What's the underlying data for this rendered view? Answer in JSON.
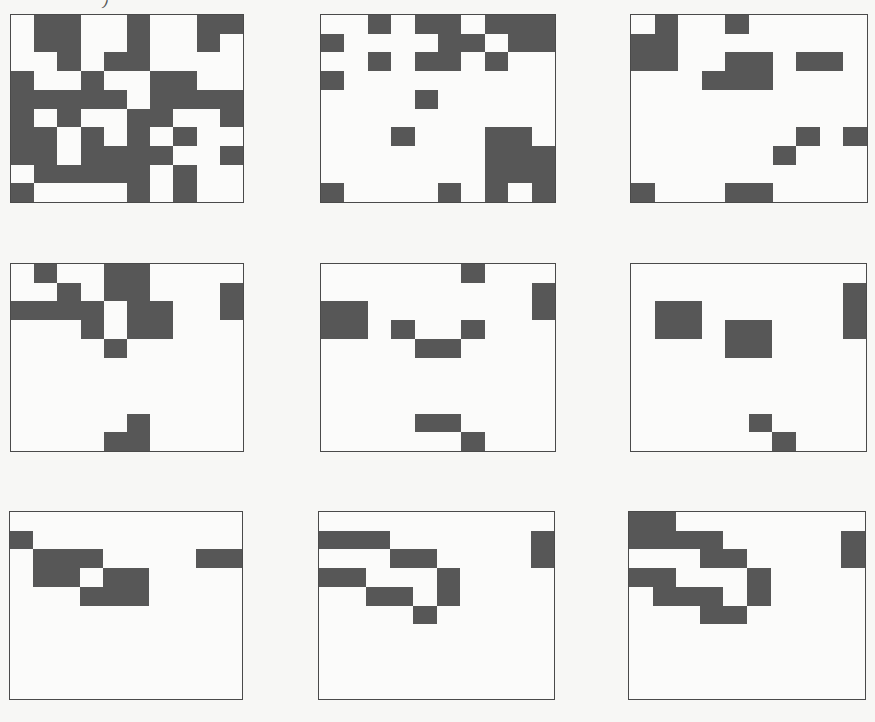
{
  "figure": {
    "top_fragment": ")",
    "grid_size": {
      "rows": 10,
      "cols": 10
    },
    "colors": {
      "filled": "#575757",
      "empty": "#fbfbfa",
      "border": "#4a4a4a",
      "background": "#f7f7f5"
    },
    "panels": [
      {
        "id": "panel-1-1",
        "row": 1,
        "col": 1,
        "cells": [
          "0110010011",
          "0110010010",
          "0010110000",
          "1001001100",
          "1111101111",
          "1010011001",
          "1101010100",
          "1101111001",
          "0111110100",
          "1000010100"
        ]
      },
      {
        "id": "panel-1-2",
        "row": 1,
        "col": 2,
        "cells": [
          "0010110111",
          "1000011011",
          "0010110100",
          "1000000000",
          "0000100000",
          "0000000000",
          "0001000110",
          "0000000111",
          "0000000111",
          "1000010101"
        ]
      },
      {
        "id": "panel-1-3",
        "row": 1,
        "col": 3,
        "cells": [
          "0100100000",
          "1100000000",
          "1100110110",
          "0001110000",
          "0000000000",
          "0000000000",
          "0000000101",
          "0000001000",
          "0000000000",
          "1000110000"
        ]
      },
      {
        "id": "panel-2-1",
        "row": 2,
        "col": 1,
        "cells": [
          "0100110000",
          "0010110001",
          "1111011001",
          "0001011000",
          "0000100000",
          "0000000000",
          "0000000000",
          "0000000000",
          "0000010000",
          "0000110000"
        ]
      },
      {
        "id": "panel-2-2",
        "row": 2,
        "col": 2,
        "cells": [
          "0000001000",
          "0000000001",
          "1100000001",
          "1101001000",
          "0000110000",
          "0000000000",
          "0000000000",
          "0000000000",
          "0000110000",
          "0000001000"
        ]
      },
      {
        "id": "panel-2-3",
        "row": 2,
        "col": 3,
        "cells": [
          "0000000000",
          "0000000001",
          "0110000001",
          "0110110001",
          "0000110000",
          "0000000000",
          "0000000000",
          "0000000000",
          "0000010000",
          "0000001000"
        ]
      },
      {
        "id": "panel-3-1",
        "row": 3,
        "col": 1,
        "cells": [
          "0000000000",
          "1000000000",
          "0111000011",
          "0110110000",
          "0001110000",
          "0000000000",
          "0000000000",
          "0000000000",
          "0000000000",
          "0000000000"
        ]
      },
      {
        "id": "panel-3-2",
        "row": 3,
        "col": 2,
        "cells": [
          "0000000000",
          "1110000001",
          "0001100001",
          "1100010000",
          "0011010000",
          "0000100000",
          "0000000000",
          "0000000000",
          "0000000000",
          "0000000000"
        ]
      },
      {
        "id": "panel-3-3",
        "row": 3,
        "col": 3,
        "cells": [
          "1100000000",
          "1111000001",
          "0001100001",
          "1100010000",
          "0111010000",
          "0001100000",
          "0000000000",
          "0000000000",
          "0000000000",
          "0000000000"
        ]
      }
    ]
  }
}
